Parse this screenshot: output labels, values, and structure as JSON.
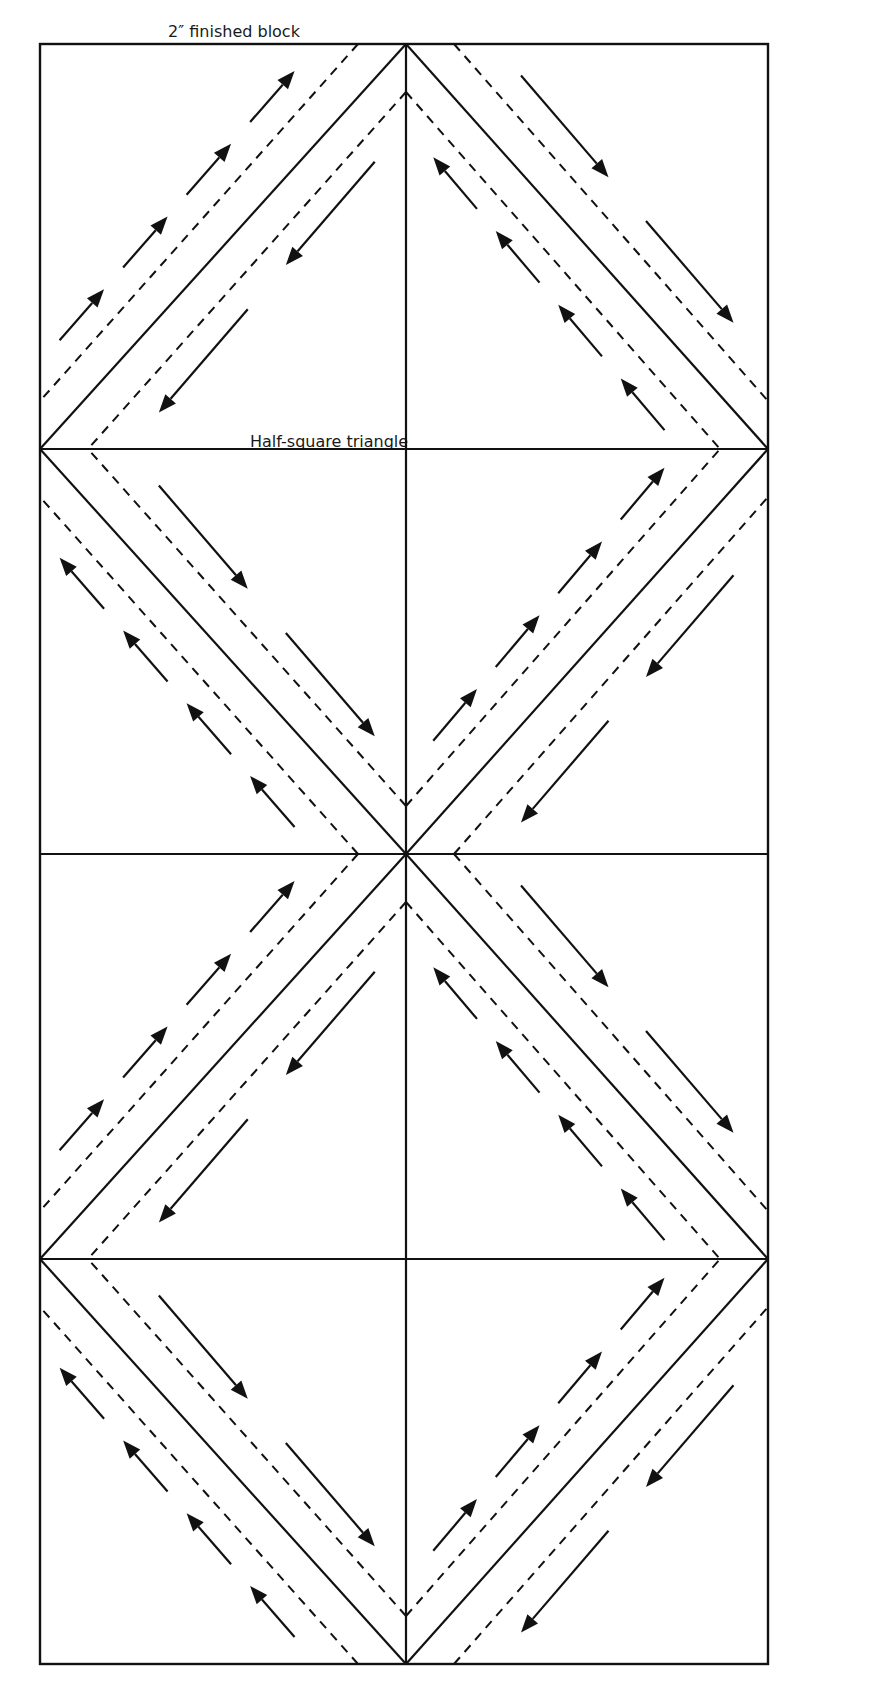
{
  "labels": {
    "title": "2″ finished block",
    "half_square_triangle": "Half-square triangle"
  },
  "diagram": {
    "type": "quilt-foundation-pattern",
    "rows": 4,
    "cols": 2,
    "units_per_row": "2 half-square triangle diamonds (diamond spans both columns)",
    "line_styles": {
      "cut_line": "solid",
      "sewing_line": "dashed",
      "sewing_direction": "arrow"
    },
    "colors": {
      "ink": "#111111",
      "background": "#ffffff"
    }
  }
}
